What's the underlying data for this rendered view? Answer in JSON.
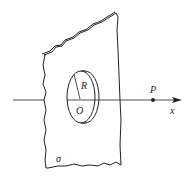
{
  "diagram": {
    "labels": {
      "radius": "R",
      "center": "O",
      "point": "P",
      "axis": "x",
      "surface_density": "σ"
    },
    "colors": {
      "stroke": "#222222",
      "background": "#ffffff"
    }
  }
}
